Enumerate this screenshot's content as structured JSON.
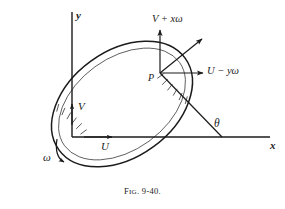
{
  "figure": {
    "caption_prefix": "F",
    "caption_smallcaps": "IG",
    "caption_number": ". 9-40.",
    "caption_full": "FIG. 9-40."
  },
  "axes": {
    "x_label": "x",
    "y_label": "y",
    "origin_x": 72,
    "origin_y": 137,
    "x_end": 270,
    "y_end": 12,
    "color": "#1b1b1b"
  },
  "body": {
    "name": "rotating-lamina",
    "shape": "ellipse",
    "center_x": 122,
    "center_y": 104,
    "radius_major": 78,
    "radius_minor": 53,
    "rotation_deg": -36,
    "outline_color": "#1b1b1b",
    "hatch_color": "#3a3a3a"
  },
  "point": {
    "label": "P",
    "x": 160,
    "y": 73
  },
  "vectors": {
    "origin_velocity_x": {
      "label": "U",
      "description": "translation velocity component along x at origin"
    },
    "origin_velocity_y": {
      "label": "V",
      "description": "translation velocity component along y at origin"
    },
    "point_velocity_y": {
      "label": "V + xω",
      "description": "vertical velocity component at P"
    },
    "point_velocity_x": {
      "label": "U − yω",
      "description": "horizontal velocity component at P"
    },
    "resultant": {
      "label": "",
      "description": "resultant velocity at P, diagonal arrow"
    }
  },
  "angle": {
    "label": "θ",
    "description": "angle between line through P and the x axis"
  },
  "rotation": {
    "label": "ω",
    "description": "angular velocity, curved arrow clockwise"
  },
  "colors": {
    "background": "#ffffff",
    "ink": "#1b1b1b"
  }
}
